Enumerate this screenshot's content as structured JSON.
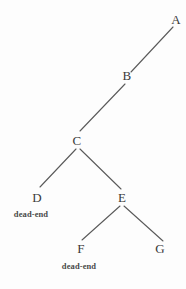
{
  "diagram": {
    "background_color": "#fdfdfd",
    "edge_color": "#5a5a5a",
    "label_color": "#3a3a3a",
    "annotation_color": "#4a4a4a",
    "width": 186,
    "height": 289,
    "nodes": [
      {
        "id": "A",
        "label": "A",
        "x": 176,
        "y": 19
      },
      {
        "id": "B",
        "label": "B",
        "x": 127,
        "y": 75
      },
      {
        "id": "C",
        "label": "C",
        "x": 77,
        "y": 140
      },
      {
        "id": "D",
        "label": "D",
        "x": 37,
        "y": 197
      },
      {
        "id": "E",
        "label": "E",
        "x": 122,
        "y": 197
      },
      {
        "id": "F",
        "label": "F",
        "x": 81,
        "y": 248
      },
      {
        "id": "G",
        "label": "G",
        "x": 160,
        "y": 248
      }
    ],
    "edges": [
      {
        "from": "A",
        "to": "B",
        "x1": 173,
        "y1": 27,
        "x2": 131,
        "y2": 72
      },
      {
        "from": "B",
        "to": "C",
        "x1": 125,
        "y1": 84,
        "x2": 80,
        "y2": 131
      },
      {
        "from": "C",
        "to": "D",
        "x1": 76,
        "y1": 149,
        "x2": 40,
        "y2": 187
      },
      {
        "from": "C",
        "to": "E",
        "x1": 80,
        "y1": 149,
        "x2": 121,
        "y2": 189
      },
      {
        "from": "E",
        "to": "F",
        "x1": 120,
        "y1": 206,
        "x2": 82,
        "y2": 240
      },
      {
        "from": "E",
        "to": "G",
        "x1": 124,
        "y1": 206,
        "x2": 163,
        "y2": 241
      }
    ],
    "annotations": [
      {
        "for": "D",
        "text": "dead-end",
        "x": 31,
        "y": 214
      },
      {
        "for": "F",
        "text": "dead-end",
        "x": 79,
        "y": 266
      }
    ]
  }
}
